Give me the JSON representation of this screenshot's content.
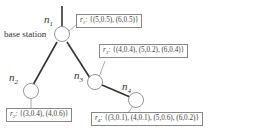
{
  "diagram": {
    "type": "tree",
    "nodes": [
      {
        "id": "n1",
        "label": "n",
        "sub": "1",
        "caption": "base station",
        "reading_label": "r",
        "reading_sub": "1",
        "readings": "{(5,0.5), (6,0.5)}"
      },
      {
        "id": "n2",
        "label": "n",
        "sub": "2",
        "reading_label": "r",
        "reading_sub": "2",
        "readings": "{(3,0.4), (4,0.6)}"
      },
      {
        "id": "n3",
        "label": "n",
        "sub": "3",
        "reading_label": "r",
        "reading_sub": "3",
        "readings": "{(4,0.4), (5,0.2), (6,0.4)}"
      },
      {
        "id": "n4",
        "label": "n",
        "sub": "4",
        "reading_label": "r",
        "reading_sub": "4",
        "readings": "{(3,0.1), (4,0.1), (5,0.6), (6,0.2)}"
      }
    ],
    "edges": [
      {
        "from": "n1",
        "to": "n2"
      },
      {
        "from": "n1",
        "to": "n3"
      },
      {
        "from": "n3",
        "to": "n4"
      }
    ],
    "colors": {
      "edge": "#333333",
      "node_stroke": "#888888",
      "box_border": "#888888"
    }
  }
}
